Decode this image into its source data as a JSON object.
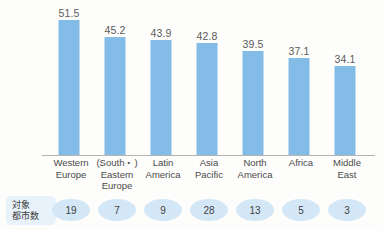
{
  "chart_data": {
    "type": "bar",
    "title": "",
    "xlabel": "",
    "ylabel": "",
    "ylim": [
      0,
      51.5
    ],
    "grid": false,
    "legend": "none",
    "categories": [
      "Western Europe",
      "(South・) Eastern Europe",
      "Latin America",
      "Asia Pacific",
      "North America",
      "Africa",
      "Middle East"
    ],
    "category_lines": [
      [
        "Western",
        "Europe"
      ],
      [
        "(South・)",
        "Eastern",
        "Europe"
      ],
      [
        "Latin",
        "America"
      ],
      [
        "Asia",
        "Pacific"
      ],
      [
        "North",
        "America"
      ],
      [
        "Africa"
      ],
      [
        "Middle",
        "East"
      ]
    ],
    "values": [
      51.5,
      45.2,
      43.9,
      42.8,
      39.5,
      37.1,
      34.1
    ],
    "value_labels": [
      "51.5",
      "45.2",
      "43.9",
      "42.8",
      "39.5",
      "37.1",
      "34.1"
    ],
    "bar_color": "#84bce8",
    "axis_color": "#b4b4b0"
  },
  "counts": {
    "label_lines": [
      "対象",
      "都市数"
    ],
    "values": [
      "19",
      "7",
      "9",
      "28",
      "13",
      "5",
      "3"
    ],
    "pill_color": "#d4e7f6",
    "label_bg_color": "#e8f2fa"
  }
}
